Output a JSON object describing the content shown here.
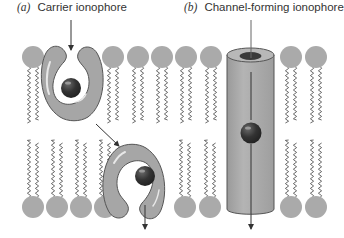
{
  "labels": {
    "a": {
      "tag": "(a)",
      "text": "Carrier ionophore"
    },
    "b": {
      "tag": "(b)",
      "text": "Channel-forming ionophore"
    }
  },
  "colors": {
    "head": "#aaaaaa",
    "ionophore_fill": "#a6a6a6",
    "ionophore_stroke": "#555555",
    "ion": "#2e2e2e",
    "tail": "#444444",
    "arrow": "#333333"
  },
  "membrane": {
    "top_heads_y": 57,
    "bottom_heads_y": 207,
    "head_radius": 11,
    "top_heads_x": [
      33,
      113,
      138,
      162,
      186,
      211,
      291,
      316
    ],
    "bottom_heads_x": [
      33,
      57,
      81,
      105,
      185,
      210,
      291,
      316
    ]
  }
}
